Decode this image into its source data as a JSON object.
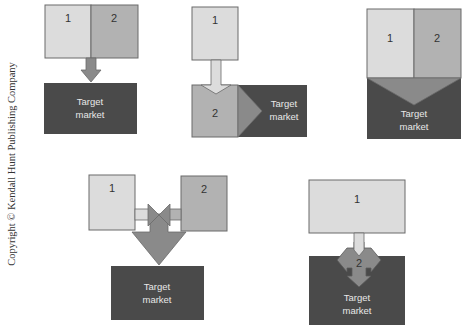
{
  "copyright": "Copyright © Kendall Hunt Publishing Company",
  "colors": {
    "light_box": "#dcdcdc",
    "mid_box": "#b2b2b2",
    "arrow": "#8a8a8a",
    "target": "#4a4a4a",
    "target_text": "#e8e8e8",
    "stroke": "#5a5a5a"
  },
  "diagrams": [
    {
      "id": "combined-concentrated",
      "labels": [
        "1",
        "2"
      ],
      "target": [
        "Target",
        "market"
      ]
    },
    {
      "id": "sequential",
      "labels": [
        "1",
        "2"
      ],
      "target": [
        "Target",
        "market"
      ]
    },
    {
      "id": "merged-wedge",
      "labels": [
        "1",
        "2"
      ],
      "target": [
        "Target",
        "market"
      ]
    },
    {
      "id": "dual-converging",
      "labels": [
        "1",
        "2"
      ],
      "target": [
        "Target",
        "market"
      ]
    },
    {
      "id": "embedded-spread",
      "labels": [
        "1",
        "2"
      ],
      "target": [
        "Target",
        "market"
      ]
    }
  ]
}
